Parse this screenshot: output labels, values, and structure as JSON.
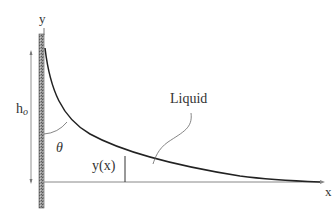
{
  "diagram": {
    "labels": {
      "y_axis": "y",
      "x_axis": "x",
      "height": "h",
      "height_subscript": "o",
      "angle": "θ",
      "local_height": "y(x)",
      "liquid": "Liquid"
    },
    "colors": {
      "stroke": "#222222",
      "axis": "#888888",
      "wall_fill": "#8a8a8a",
      "text": "#333333"
    }
  }
}
